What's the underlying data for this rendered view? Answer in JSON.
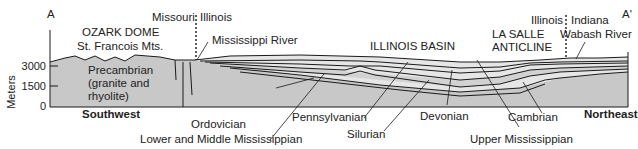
{
  "section": {
    "start_label": "A",
    "end_label": "A'",
    "y_axis_label": "Meters",
    "y_ticks": [
      "3000",
      "1500",
      "0"
    ],
    "direction_left": "Southwest",
    "direction_right": "Northeast"
  },
  "regions": {
    "ozark_line1": "OZARK DOME",
    "ozark_line2": "St. Francois Mts.",
    "basin": "ILLINOIS BASIN",
    "anticline_line1": "LA SALLE",
    "anticline_line2": "ANTICLINE"
  },
  "boundaries": {
    "left_state_a": "Missouri",
    "left_state_b": "Illinois",
    "right_state_a": "Illinois",
    "right_state_b": "Indiana"
  },
  "rivers": {
    "mississippi": "Mississippi River",
    "wabash": "Wabash River"
  },
  "units": {
    "precambrian_line1": "Precambrian",
    "precambrian_line2": "(granite and",
    "precambrian_line3": "rhyolite)",
    "ordovician": "Ordovician",
    "lower_middle_mississippian": "Lower and Middle Mississippian",
    "pennsylvanian": "Pennsylvanian",
    "silurian": "Silurian",
    "devonian": "Devonian",
    "upper_mississippian": "Upper Mississippian",
    "cambrian": "Cambrian"
  },
  "colors": {
    "basement_fill": "#c8c8c8",
    "layer_light": "#e6e6e6",
    "layer_mid": "#d2d2d2",
    "line": "#1a1a1a"
  }
}
